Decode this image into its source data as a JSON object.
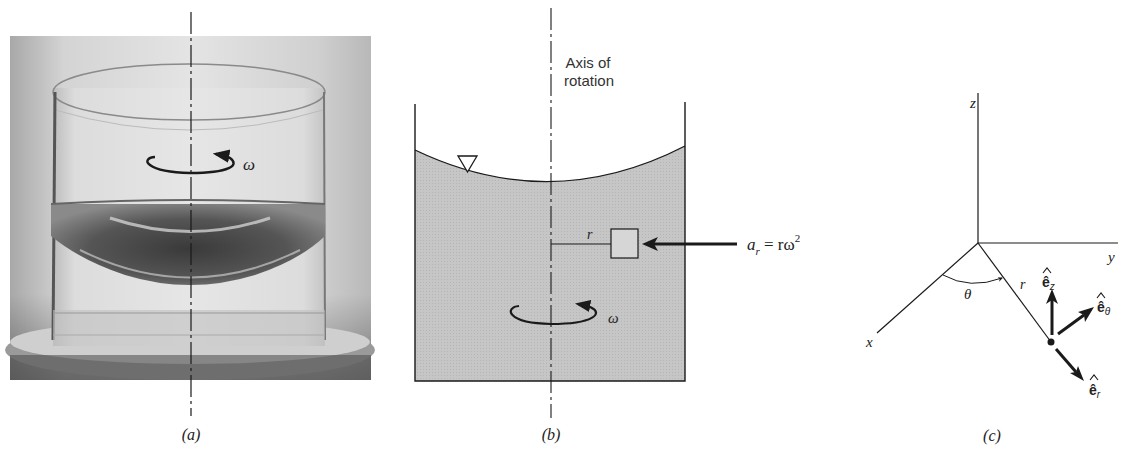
{
  "panels": {
    "a": {
      "caption": "(a)",
      "omega_label": "ω"
    },
    "b": {
      "caption": "(b)",
      "axis_label_line1": "Axis of",
      "axis_label_line2": "rotation",
      "radius_label": "r",
      "omega_label": "ω",
      "accel_label_a": "a",
      "accel_label_sub": "r",
      "accel_label_eq": " = rω",
      "accel_label_sup": "2"
    },
    "c": {
      "caption": "(c)",
      "axis_x": "x",
      "axis_y": "y",
      "axis_z": "z",
      "angle_label": "θ",
      "radius_label": "r",
      "unit_vectors": [
        {
          "base": "ê",
          "sub": "z"
        },
        {
          "base": "ê",
          "sub": "θ"
        },
        {
          "base": "ê",
          "sub": "r"
        }
      ]
    }
  },
  "colors": {
    "ink": "#1a1a1a",
    "fluid_fill": "#c9c9c9",
    "photo_bg": "#d8d8d8"
  }
}
